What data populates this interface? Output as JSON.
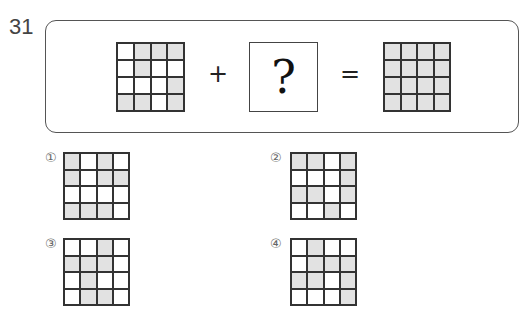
{
  "question": {
    "number": "31",
    "plus": "+",
    "equals": "=",
    "unknown": "?",
    "first_grid": [
      [
        0,
        1,
        1,
        1
      ],
      [
        0,
        1,
        0,
        0
      ],
      [
        0,
        0,
        0,
        1
      ],
      [
        1,
        1,
        0,
        1
      ]
    ],
    "result_grid": [
      [
        1,
        1,
        1,
        1
      ],
      [
        1,
        1,
        1,
        1
      ],
      [
        1,
        1,
        1,
        1
      ],
      [
        1,
        1,
        1,
        1
      ]
    ]
  },
  "options": [
    {
      "label": "①",
      "grid": [
        [
          1,
          0,
          1,
          0
        ],
        [
          1,
          0,
          1,
          1
        ],
        [
          0,
          0,
          0,
          0
        ],
        [
          1,
          1,
          1,
          0
        ]
      ]
    },
    {
      "label": "②",
      "grid": [
        [
          1,
          1,
          0,
          1
        ],
        [
          0,
          0,
          0,
          1
        ],
        [
          1,
          1,
          0,
          1
        ],
        [
          0,
          0,
          1,
          0
        ]
      ]
    },
    {
      "label": "③",
      "grid": [
        [
          0,
          0,
          1,
          0
        ],
        [
          1,
          1,
          1,
          0
        ],
        [
          0,
          1,
          0,
          0
        ],
        [
          0,
          1,
          1,
          0
        ]
      ]
    },
    {
      "label": "④",
      "grid": [
        [
          0,
          1,
          0,
          0
        ],
        [
          0,
          1,
          1,
          1
        ],
        [
          1,
          1,
          0,
          1
        ],
        [
          0,
          0,
          0,
          1
        ]
      ]
    }
  ],
  "colors": {
    "shaded": "#e2e2e2",
    "line": "#333333"
  }
}
